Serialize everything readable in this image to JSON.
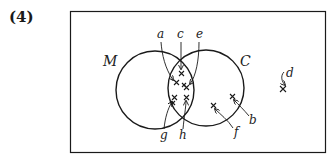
{
  "problem_number": "(4)",
  "sets": [
    {
      "id": "M",
      "label": "M"
    },
    {
      "id": "C",
      "label": "C"
    }
  ],
  "points": [
    {
      "label": "a",
      "region": "M∩C"
    },
    {
      "label": "c",
      "region": "M∩C"
    },
    {
      "label": "e",
      "region": "M∩C"
    },
    {
      "label": "g",
      "region": "M∩C"
    },
    {
      "label": "h",
      "region": "M∩C"
    },
    {
      "label": "b",
      "region": "C only"
    },
    {
      "label": "f",
      "region": "C only"
    },
    {
      "label": "d",
      "region": "outside"
    }
  ],
  "colors": {
    "stroke": "#1a1a1a",
    "background": "#ffffff"
  }
}
